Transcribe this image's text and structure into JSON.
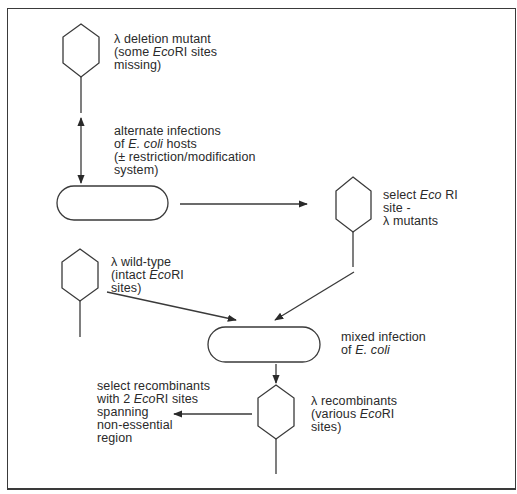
{
  "diagram": {
    "nodes": [
      {
        "id": "deletion-mutant",
        "shape": "phage",
        "lines": [
          "λ deletion mutant",
          "(some |EcoRI| sites",
          "missing)"
        ]
      },
      {
        "id": "host-1",
        "shape": "capsule"
      },
      {
        "id": "site-mutants",
        "shape": "phage",
        "lines": [
          "select |Eco| RI",
          "site -",
          "λ mutants"
        ]
      },
      {
        "id": "wild-type",
        "shape": "phage",
        "lines": [
          "λ wild-type",
          "(intact |Eco|RI",
          "sites)"
        ]
      },
      {
        "id": "host-2",
        "shape": "capsule"
      },
      {
        "id": "recombinants",
        "shape": "phage",
        "lines": [
          "λ recombinants",
          "(various |Eco|RI",
          "sites)"
        ]
      }
    ],
    "labels": {
      "deletion_mutant": {
        "l1": "λ deletion mutant",
        "l2a": "(some ",
        "l2b": "Eco",
        "l2c": "RI sites",
        "l3": "missing)"
      },
      "alternate_infections": {
        "l1": "alternate infections",
        "l2a": "of ",
        "l2b": "E. coli",
        "l2c": " hosts",
        "l3": "(± restriction/modification",
        "l4": "system)"
      },
      "select_site_mutants": {
        "l1a": "select ",
        "l1b": "Eco",
        "l1c": " RI",
        "l2": "site -",
        "l3": "λ mutants"
      },
      "wild_type": {
        "l1": "λ wild-type",
        "l2a": "(intact ",
        "l2b": "Eco",
        "l2c": "RI",
        "l3": "sites)"
      },
      "mixed_infection": {
        "l1": "mixed infection",
        "l2a": "of ",
        "l2b": "E. coli"
      },
      "recombinants": {
        "l1": "λ recombinants",
        "l2a": "(various ",
        "l2b": "Eco",
        "l2c": "RI",
        "l3": "sites)"
      },
      "select_recombinants": {
        "l1": "select recombinants",
        "l2a": "with 2 ",
        "l2b": "Eco",
        "l2c": "RI sites",
        "l3": "spanning",
        "l4": "non-essential",
        "l5": "region"
      }
    },
    "edges": [
      {
        "from": "deletion-mutant",
        "to": "host-1",
        "type": "bidirectional",
        "label": "alternate_infections"
      },
      {
        "from": "host-1",
        "to": "site-mutants",
        "type": "arrow"
      },
      {
        "from": "site-mutants",
        "to": "host-2",
        "type": "arrow"
      },
      {
        "from": "wild-type",
        "to": "host-2",
        "type": "arrow"
      },
      {
        "from": "host-2",
        "to": "recombinants",
        "type": "arrow"
      },
      {
        "from": "recombinants",
        "to": "select_recombinants",
        "type": "arrow"
      }
    ],
    "stroke_color": "#3a3a3a"
  }
}
